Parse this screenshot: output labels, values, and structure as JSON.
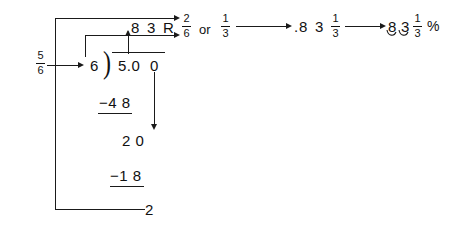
{
  "diagram": {
    "ink_color": "#1a1a1a",
    "background": "#ffffff"
  },
  "source_fraction": {
    "numerator": "5",
    "denominator": "6"
  },
  "long_division": {
    "divisor": "6",
    "paren": ")",
    "dividend": "5.0",
    "dividend_extra_zero": "0",
    "quotient_decimal_point": ".",
    "quotient_digit_1": "8",
    "quotient_digit_2": "3",
    "remainder_label": "R",
    "subtract_1": "−4 8",
    "partial": "2 0",
    "subtract_2": "−1 8",
    "final_remainder": "2"
  },
  "remainder_fraction": {
    "numerator": "2",
    "denominator": "6"
  },
  "connector_word": "or",
  "simplified_fraction": {
    "numerator": "1",
    "denominator": "3"
  },
  "step_decimal": {
    "decimal_point": ".",
    "digit_1": "8",
    "digit_2": "3",
    "fraction_numerator": "1",
    "fraction_denominator": "3"
  },
  "step_percent": {
    "digit_1": "8",
    "digit_2": "3",
    "fraction_numerator": "1",
    "fraction_denominator": "3",
    "percent_symbol": "%"
  },
  "icons": {
    "arrow_right": "arrow-right-icon",
    "arrow_up": "arrow-up-icon",
    "arrow_down": "arrow-down-icon",
    "decimal_shift_arc": "decimal-shift-arc-icon"
  }
}
